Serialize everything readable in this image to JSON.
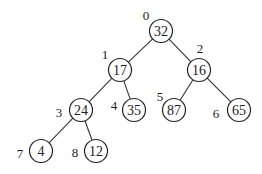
{
  "diagram": {
    "type": "binary-heap-tree",
    "nodes": [
      {
        "index": "0",
        "value": "32",
        "x": 161,
        "y": 31,
        "lx": 146,
        "ly": 15
      },
      {
        "index": "1",
        "value": "17",
        "x": 120,
        "y": 70,
        "lx": 105,
        "ly": 54
      },
      {
        "index": "2",
        "value": "16",
        "x": 199,
        "y": 70,
        "lx": 200,
        "ly": 48
      },
      {
        "index": "3",
        "value": "24",
        "x": 81,
        "y": 110,
        "lx": 59,
        "ly": 112
      },
      {
        "index": "4",
        "value": "35",
        "x": 134,
        "y": 110,
        "lx": 114,
        "ly": 105
      },
      {
        "index": "5",
        "value": "87",
        "x": 174,
        "y": 110,
        "lx": 160,
        "ly": 96
      },
      {
        "index": "6",
        "value": "65",
        "x": 239,
        "y": 110,
        "lx": 216,
        "ly": 113
      },
      {
        "index": "7",
        "value": "4",
        "x": 41,
        "y": 151,
        "lx": 20,
        "ly": 153
      },
      {
        "index": "8",
        "value": "12",
        "x": 96,
        "y": 151,
        "lx": 75,
        "ly": 152
      }
    ],
    "edges": [
      {
        "from": 0,
        "to": 1
      },
      {
        "from": 0,
        "to": 2
      },
      {
        "from": 1,
        "to": 3
      },
      {
        "from": 1,
        "to": 4
      },
      {
        "from": 2,
        "to": 5
      },
      {
        "from": 2,
        "to": 6
      },
      {
        "from": 3,
        "to": 7
      },
      {
        "from": 3,
        "to": 8
      }
    ],
    "node_radius": 11.5
  }
}
